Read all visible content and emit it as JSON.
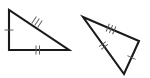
{
  "canvas": {
    "width": 150,
    "height": 78,
    "background_color": "#ffffff",
    "stroke_color": "#1a1a1a",
    "tick_color": "#5e5e5e",
    "title": "Two congruent triangles with congruence tick marks"
  },
  "figures": [
    {
      "id": "triangle-left",
      "name": "left-triangle",
      "description": "Right triangle, right angle at lower-left",
      "stroke_width": 2.1,
      "points": "9,10 9,50 69,50",
      "vertices": [
        {
          "name": "top-left-vertex",
          "x": 9,
          "y": 10
        },
        {
          "name": "bottom-left-vertex",
          "x": 9,
          "y": 50
        },
        {
          "name": "bottom-right-vertex",
          "x": 69,
          "y": 50
        }
      ],
      "edges": [
        {
          "name": "vertical-leg",
          "from": [
            9,
            10
          ],
          "to": [
            9,
            50
          ],
          "tick_count": 1,
          "tick_label": "single-tick"
        },
        {
          "name": "horizontal-leg",
          "from": [
            9,
            50
          ],
          "to": [
            69,
            50
          ],
          "tick_count": 2,
          "tick_label": "double-tick"
        },
        {
          "name": "hypotenuse",
          "from": [
            9,
            10
          ],
          "to": [
            69,
            50
          ],
          "tick_count": 3,
          "tick_label": "triple-tick"
        }
      ]
    },
    {
      "id": "triangle-right",
      "name": "right-triangle-rotated",
      "description": "Congruent triangle rotated, apex pointing down",
      "stroke_width": 2.1,
      "points": "83,17 139,41 124,74",
      "vertices": [
        {
          "name": "left-vertex",
          "x": 83,
          "y": 17
        },
        {
          "name": "right-vertex",
          "x": 139,
          "y": 41
        },
        {
          "name": "bottom-vertex",
          "x": 124,
          "y": 74
        }
      ],
      "edges": [
        {
          "name": "top-edge",
          "from": [
            83,
            17
          ],
          "to": [
            139,
            41
          ],
          "tick_count": 3,
          "tick_label": "triple-tick"
        },
        {
          "name": "left-edge",
          "from": [
            83,
            17
          ],
          "to": [
            124,
            74
          ],
          "tick_count": 2,
          "tick_label": "double-tick"
        },
        {
          "name": "right-edge",
          "from": [
            139,
            41
          ],
          "to": [
            124,
            74
          ],
          "tick_count": 1,
          "tick_label": "single-tick"
        }
      ]
    }
  ]
}
